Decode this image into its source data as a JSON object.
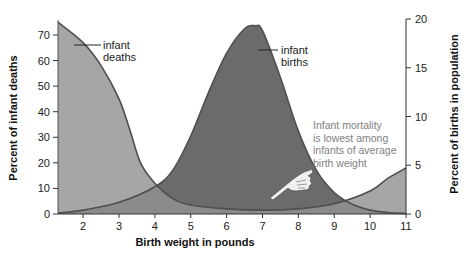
{
  "chart_data": {
    "type": "area",
    "title": "",
    "xlabel": "Birth weight in pounds",
    "ylabel_left": "Percent of infant deaths",
    "ylabel_right": "Percent of births in population",
    "x_ticks": [
      2,
      3,
      4,
      5,
      6,
      7,
      8,
      9,
      10,
      11
    ],
    "xlim": [
      1.3,
      11
    ],
    "ylim_left": [
      0,
      75
    ],
    "ylim_right": [
      0,
      20
    ],
    "y_ticks_left": [
      0,
      10,
      20,
      30,
      40,
      50,
      60,
      70
    ],
    "y_ticks_right": [
      0,
      5,
      10,
      15,
      20
    ],
    "grid": false,
    "series": [
      {
        "name": "infant deaths",
        "axis": "left",
        "color": "#a6a6a6",
        "x": [
          1.3,
          2,
          2.5,
          3,
          3.3,
          3.6,
          4,
          4.5,
          5,
          6,
          7,
          8,
          9,
          10,
          10.5,
          11
        ],
        "values": [
          75,
          67,
          58,
          45,
          33,
          20,
          12,
          6,
          3.5,
          2,
          1.5,
          2,
          4,
          9,
          14,
          18
        ]
      },
      {
        "name": "infant births",
        "axis": "right",
        "color": "#6b6b6b",
        "x": [
          1.3,
          2,
          3,
          4,
          4.5,
          5,
          5.5,
          6,
          6.5,
          6.8,
          7,
          7.5,
          8,
          8.5,
          9,
          9.5,
          10,
          10.5,
          11
        ],
        "values": [
          0.1,
          0.4,
          1.2,
          2.8,
          4.5,
          8,
          12.5,
          16.5,
          19,
          19.3,
          18.8,
          14,
          8.5,
          4.5,
          2.2,
          1,
          0.4,
          0.15,
          0.05
        ]
      }
    ],
    "annotations": [
      {
        "text": [
          "infant",
          "deaths"
        ],
        "target": "infant deaths"
      },
      {
        "text": [
          "infant",
          "births"
        ],
        "target": "infant births"
      },
      {
        "text": [
          "Infant mortality",
          "is lowest among",
          "infants of average",
          "birth weight"
        ],
        "pointer": "pointing-hand"
      }
    ]
  }
}
